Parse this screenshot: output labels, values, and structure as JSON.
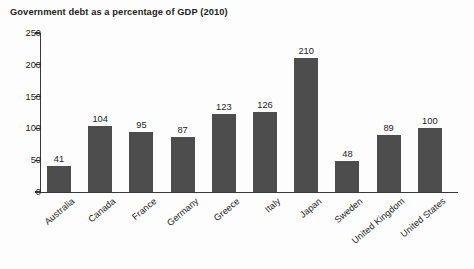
{
  "chart_data": {
    "type": "bar",
    "title": "Government debt as a percentage of GDP (2010)",
    "xlabel": "",
    "ylabel": "",
    "ylim": [
      0,
      250
    ],
    "yticks": [
      0,
      50,
      100,
      150,
      200,
      250
    ],
    "grid": false,
    "legend": null,
    "bar_color": "#4d4d4d",
    "categories": [
      "Australia",
      "Canada",
      "France",
      "Germany",
      "Greece",
      "Italy",
      "Japan",
      "Sweden",
      "United Kingdom",
      "United States"
    ],
    "values": [
      41,
      104,
      95,
      87,
      123,
      126,
      210,
      48,
      89,
      100
    ],
    "value_labels": [
      "41",
      "104",
      "95",
      "87",
      "123",
      "126",
      "210",
      "48",
      "89",
      "100"
    ],
    "ytick_labels": [
      "0",
      "50",
      "100",
      "150",
      "200",
      "250"
    ]
  }
}
